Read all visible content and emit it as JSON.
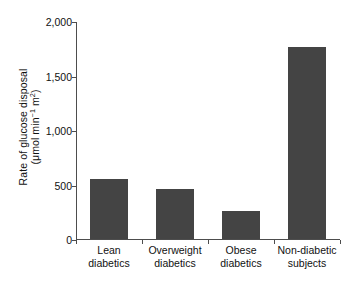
{
  "chart_data": {
    "type": "bar",
    "title": "",
    "xlabel": "",
    "ylabel": "Rate of glucose disposal (μmol min−1 m2)",
    "ylabel_line1": "Rate of glucose disposal",
    "ylabel_line2_prefix": "(μmol min",
    "ylabel_line2_exp1": "−1",
    "ylabel_line2_mid": " m",
    "ylabel_line2_exp2": "2",
    "ylabel_line2_suffix": ")",
    "categories": [
      "Lean diabetics",
      "Overweight diabetics",
      "Obese diabetics",
      "Non-diabetic subjects"
    ],
    "category_lines": [
      [
        "Lean diabetics"
      ],
      [
        "Overweight",
        "diabetics"
      ],
      [
        "Obese",
        "diabetics"
      ],
      [
        "Non-diabetic",
        "subjects"
      ]
    ],
    "values": [
      550,
      460,
      260,
      1760
    ],
    "ylim": [
      0,
      2000
    ],
    "yticks": [
      0,
      500,
      1000,
      1500,
      2000
    ],
    "ytick_labels": [
      "0",
      "500",
      "1,000",
      "1,500",
      "2,000"
    ],
    "grid": false,
    "legend": false,
    "bar_color": "#444444",
    "axis_color": "#4d4d4d",
    "background": "#ffffff"
  }
}
